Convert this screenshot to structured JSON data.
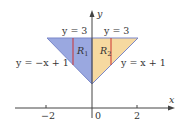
{
  "diagram": {
    "axes": {
      "x_label": "x",
      "y_label": "y",
      "x_ticks": [
        "−2",
        "0",
        "2"
      ]
    },
    "regions": [
      {
        "name": "R",
        "sub": "1",
        "color": "#9aa8e0"
      },
      {
        "name": "R",
        "sub": "2",
        "color": "#f6d9a0"
      }
    ],
    "lines": {
      "top_left": "y = 3",
      "top_right": "y = 3",
      "left": "y = −x + 1",
      "right": "y = x + 1"
    },
    "colors": {
      "edge": "#7a87c9",
      "strip": "#cc3333",
      "axis": "#444444"
    }
  }
}
